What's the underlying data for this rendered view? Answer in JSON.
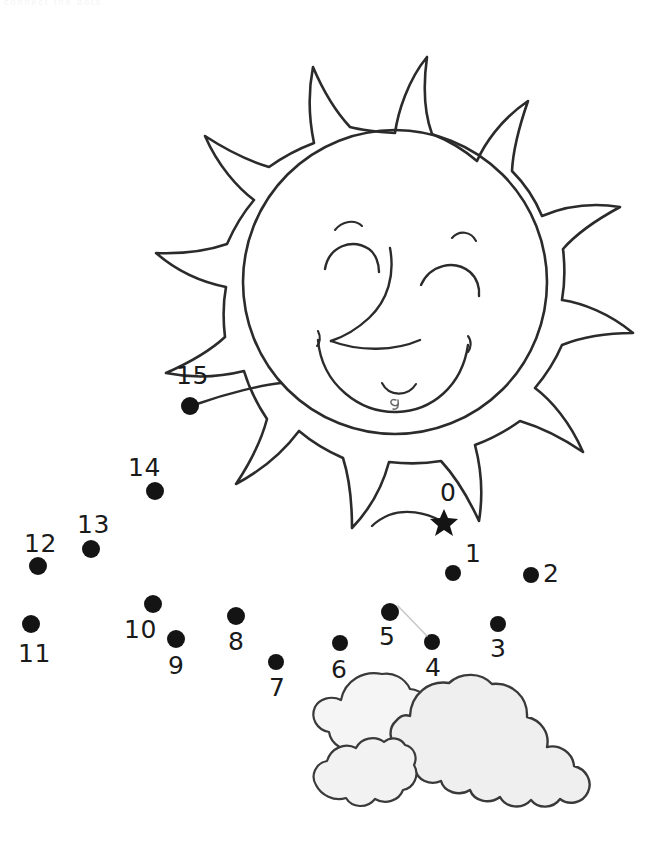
{
  "page": {
    "width": 656,
    "height": 857,
    "background_color": "#ffffff",
    "header_note": "connect the dots"
  },
  "colors": {
    "ink": "#1a1a1a",
    "outline": "#2b2b2b",
    "cloud_fill": "#f0f0f0",
    "cloud_fill_back": "#f7f7f7",
    "dot_fill": "#141414",
    "paper": "#ffffff"
  },
  "puzzle": {
    "type": "dot-to-dot",
    "start_marker": "star",
    "dot_count": 16,
    "number_range": "0-15",
    "dots": [
      {
        "label": "0",
        "shape": "star",
        "dot_x": 444,
        "dot_y": 521,
        "label_x": 440,
        "label_y": 480,
        "r": 9
      },
      {
        "label": "1",
        "shape": "circle",
        "dot_x": 453,
        "dot_y": 573,
        "label_x": 465,
        "label_y": 541,
        "r": 8
      },
      {
        "label": "2",
        "shape": "circle",
        "dot_x": 531,
        "dot_y": 575,
        "label_x": 543,
        "label_y": 561,
        "r": 8
      },
      {
        "label": "3",
        "shape": "circle",
        "dot_x": 498,
        "dot_y": 624,
        "label_x": 490,
        "label_y": 636,
        "r": 8
      },
      {
        "label": "4",
        "shape": "circle",
        "dot_x": 432,
        "dot_y": 642,
        "label_x": 425,
        "label_y": 655,
        "r": 8
      },
      {
        "label": "5",
        "shape": "circle",
        "dot_x": 390,
        "dot_y": 612,
        "label_x": 379,
        "label_y": 624,
        "r": 9
      },
      {
        "label": "6",
        "shape": "circle",
        "dot_x": 340,
        "dot_y": 643,
        "label_x": 331,
        "label_y": 657,
        "r": 8
      },
      {
        "label": "7",
        "shape": "circle",
        "dot_x": 276,
        "dot_y": 662,
        "label_x": 269,
        "label_y": 675,
        "r": 8
      },
      {
        "label": "8",
        "shape": "circle",
        "dot_x": 236,
        "dot_y": 616,
        "label_x": 228,
        "label_y": 629,
        "r": 9
      },
      {
        "label": "9",
        "shape": "circle",
        "dot_x": 176,
        "dot_y": 639,
        "label_x": 168,
        "label_y": 653,
        "r": 9
      },
      {
        "label": "10",
        "shape": "circle",
        "dot_x": 153,
        "dot_y": 604,
        "label_x": 124,
        "label_y": 617,
        "r": 9
      },
      {
        "label": "11",
        "shape": "circle",
        "dot_x": 31,
        "dot_y": 624,
        "label_x": 18,
        "label_y": 641,
        "r": 9
      },
      {
        "label": "12",
        "shape": "circle",
        "dot_x": 38,
        "dot_y": 566,
        "label_x": 24,
        "label_y": 531,
        "r": 9
      },
      {
        "label": "13",
        "shape": "circle",
        "dot_x": 91,
        "dot_y": 549,
        "label_x": 77,
        "label_y": 512,
        "r": 9
      },
      {
        "label": "14",
        "shape": "circle",
        "dot_x": 155,
        "dot_y": 491,
        "label_x": 128,
        "label_y": 455,
        "r": 9
      },
      {
        "label": "15",
        "shape": "circle",
        "dot_x": 190,
        "dot_y": 406,
        "label_x": 176,
        "label_y": 363,
        "r": 9
      }
    ]
  },
  "artwork": {
    "sun": {
      "name": "smiling-sun",
      "face_center_x": 395,
      "face_center_y": 282,
      "face_radius": 152,
      "ray_count": 12,
      "face_features": [
        "left-eyebrow",
        "right-eyebrow",
        "left-closed-eye",
        "right-closed-eye",
        "nose",
        "smile",
        "chin-dimple",
        "mouth-corner-left",
        "mouth-corner-right"
      ]
    },
    "clouds": {
      "name": "cloud-cluster",
      "puff_count": 3,
      "bounds": {
        "x": 308,
        "y": 670,
        "width": 290,
        "height": 152
      }
    }
  }
}
